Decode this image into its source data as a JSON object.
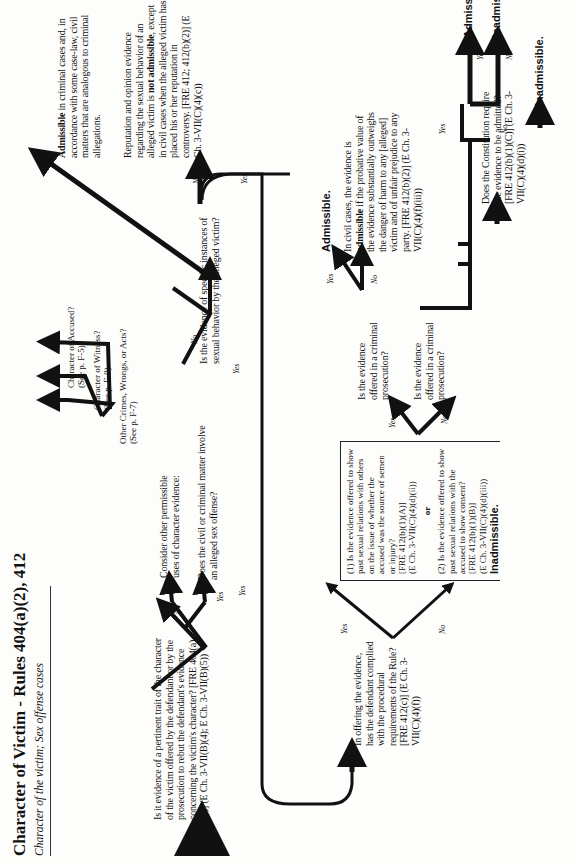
{
  "header": {
    "title": "Character of Victim - Rules 404(a)(2), 412",
    "subtitle": "Character of the victim; Sex offense cases"
  },
  "nodes": {
    "q_pertinent_trait": "Is it evidence of a pertinent trait of the character of the victim offered by the defendant or by the prosecution to rebut the defendant's evidence concerning the victim's character? [FRE 404(a)(2)] (E Ch. 3-VII(B)(4); E Ch. 3-VII(B)(5))",
    "consider_other_uses": "Consider other permissible uses of character evidence:",
    "other_uses": [
      {
        "label": "Character of Accused?",
        "ref": "(See p. F-5)"
      },
      {
        "label": "Character of Witness?",
        "ref": "(See p. F-9)"
      },
      {
        "label": "Other Crimes, Wrongs, or Acts?",
        "ref": "(See p. F-7)"
      }
    ],
    "q_sex_offense": "Does the civil or criminal matter involve an alleged sex offense?",
    "admissible_criminal": {
      "bold": "Admissible",
      "rest": " in criminal cases and, in accordance with some case-law, civil matters that are analogous to criminal allegations."
    },
    "q_specific_instances": "Is the evidence of specific instances of sexual behavior by the alleged victim?",
    "reputation_opinion": {
      "part1": "Reputation and opinion evidence regarding the sexual behavior of an alleged victim is ",
      "bold1": "not admissible",
      "part2": ", except in civil cases when the alleged victim has placed his or her reputation in controversy. [FRE 412; 412(b)(2)] (E Ch. 3-VII(C)(4)(c))"
    },
    "q_procedural": "In offering the evidence, has the defendant complied with the procedural requirements of the Rule? [FRE 412(c)] (E Ch. 3-VII(C)(4)(f))",
    "box_q1": "(1) Is the evidence offered to show past sexual relations with others on the issue of whether the accused was the source of semen or injury?",
    "box_q1_ref": "[FRE 412(b)(1)(A)]",
    "box_q1_ref2": "(E Ch. 3-VII(C)(4)(d)(ii))",
    "box_or": "or",
    "box_q2": "(2) Is the evidence offered to show past sexual relations with the accused to show consent?",
    "box_q2_ref": "[FRE 412(b)(1)(B)]",
    "box_q2_ref2": "(E Ch. 3-VII(C)(4)(d)(iii))",
    "inadmissible_1": "Inadmissible.",
    "q_criminal_1": "Is the evidence offered in a criminal prosecution?",
    "q_criminal_2": "Is the evidence offered in a criminal prosecution?",
    "admissible_1": "Admissible.",
    "civil_cases": {
      "part1": "In civil cases, the evidence is ",
      "bold1": "admissible",
      "part2": " if the probative value of the evidence substantially outweighs the danger of harm to any [alleged] victim and of unfair prejudice to any party. [FRE 412(b)(2)] (E Ch. 3-VII(C)(4)(f)(iii))"
    },
    "q_constitution": "Does the Constitution require the evidence to be admitted? [FRE 412(b)(1)(C)] (E Ch. 3-VII(C)(4)(d)(i))",
    "admissible_2": "Admissible.",
    "inadmissible_2": "Inadmissible.",
    "inadmissible_3": "Inadmissible."
  },
  "branch_labels": {
    "yes": "Yes",
    "no": "No"
  }
}
